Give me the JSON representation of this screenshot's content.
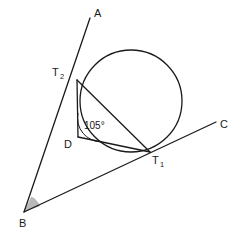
{
  "figure": {
    "kind": "geometry-diagram",
    "background_color": "#ffffff",
    "stroke_color": "#1a1a1a",
    "shade_color": "#b8b8b8",
    "stroke_width": 1.3
  },
  "points": {
    "A": {
      "label": "A",
      "x": 90,
      "y": 18,
      "label_x": 94,
      "label_y": 17
    },
    "B": {
      "label": "B",
      "x": 24,
      "y": 212,
      "label_x": 19,
      "label_y": 227
    },
    "C": {
      "label": "C",
      "x": 216,
      "y": 122,
      "label_x": 220,
      "label_y": 128
    },
    "D": {
      "label": "D",
      "x": 78,
      "y": 137,
      "label_x": 64,
      "label_y": 148
    },
    "T1": {
      "label": "T",
      "sub": "1",
      "x": 150,
      "y": 152,
      "label_x": 152,
      "label_y": 164
    },
    "T2": {
      "label": "T",
      "sub": "2",
      "x": 77,
      "y": 80,
      "label_x": 52,
      "label_y": 76
    }
  },
  "circle": {
    "center_x": 131,
    "center_y": 101,
    "radius": 51
  },
  "segments": [
    {
      "name": "ray-BA",
      "from": "B",
      "to": "A"
    },
    {
      "name": "ray-BC",
      "from": "B",
      "to": "C"
    },
    {
      "name": "chord-T2-T1",
      "from": "T2",
      "to": "T1"
    },
    {
      "name": "chord-T2-D",
      "from": "T2",
      "to": "D"
    },
    {
      "name": "chord-D-T1",
      "from": "D",
      "to": "T1"
    }
  ],
  "angles": {
    "at_D": {
      "value": "105°",
      "label_x": 84,
      "label_y": 129,
      "arc_radius": 24,
      "marked": true
    },
    "at_B": {
      "value": "",
      "shaded": true,
      "wedge_radius": 17
    }
  }
}
